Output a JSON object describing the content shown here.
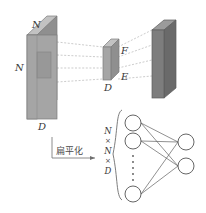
{
  "figure": {
    "background": "#ffffff"
  },
  "input_volume": {
    "name": "input-volume",
    "label_top": "N",
    "label_left": "N",
    "label_bottom": "D",
    "face_color": "#a8a8a8",
    "top_color": "#c2c2c2",
    "side_color": "#8f8f8f",
    "patch_color": "#9a9a9a"
  },
  "filter_volume": {
    "name": "filter-volume",
    "label_depth": "D",
    "label_top_right": "F",
    "label_bottom_right": "E",
    "face_color": "#a8a8a8",
    "top_color": "#c2c2c2",
    "side_color": "#8f8f8f"
  },
  "output_volume": {
    "name": "output-volume",
    "face_color": "#7d7d7d",
    "top_color": "#9b9b9b",
    "side_color": "#6a6a6a"
  },
  "flatten": {
    "name": "flatten-arrow",
    "text": "扁平化"
  },
  "flat_vector": {
    "name": "flattened-vector-label",
    "parts": [
      "N",
      "×",
      "N",
      "×",
      "D"
    ],
    "brace": "{"
  },
  "network": {
    "name": "fully-connected-network",
    "input_nodes": 3,
    "output_nodes": 2,
    "dots": 5,
    "node_fill": "#ffffff",
    "node_stroke": "#555555",
    "edge_color": "#555555"
  },
  "colors": {
    "dashed_line": "#b6b6b6",
    "outline": "#6e6e6e",
    "text": "#3a3a3a"
  }
}
